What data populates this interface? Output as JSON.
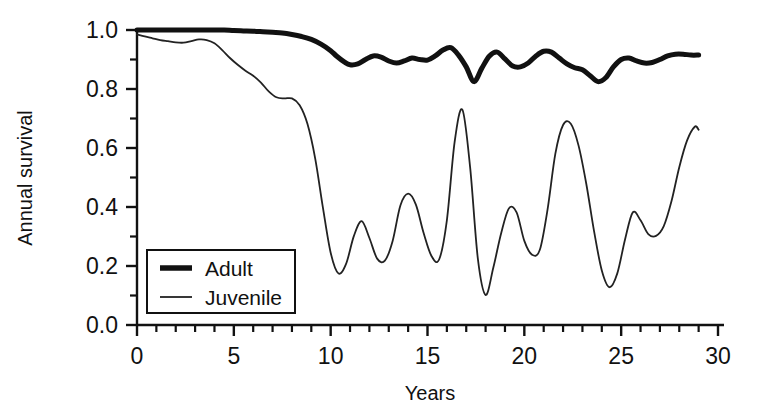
{
  "chart_data": {
    "type": "line",
    "title": "",
    "xlabel": "Years",
    "ylabel": "Annual survival",
    "xlim": [
      0,
      30
    ],
    "ylim": [
      0.0,
      1.0
    ],
    "grid": false,
    "legend_position": "lower-left",
    "x_major_ticks": [
      0,
      5,
      10,
      15,
      20,
      25,
      30
    ],
    "x_major_tick_labels": [
      "0",
      "5",
      "10",
      "15",
      "20",
      "25",
      "30"
    ],
    "x_minor_tick_step": 1,
    "y_major_ticks": [
      0.0,
      0.2,
      0.4,
      0.6,
      0.8,
      1.0
    ],
    "y_major_tick_labels": [
      "0.0",
      "0.2",
      "0.4",
      "0.6",
      "0.8",
      "1.0"
    ],
    "y_minor_tick_step": 0.1,
    "series": [
      {
        "name": "Adult",
        "line_width": 5,
        "color": "#111111",
        "x": [
          0,
          0.5,
          1,
          1.5,
          2,
          2.5,
          3,
          3.5,
          4,
          4.5,
          5,
          5.5,
          6,
          6.5,
          7,
          7.5,
          8,
          8.5,
          9,
          9.5,
          10,
          10.3,
          10.7,
          11,
          11.4,
          11.8,
          12.2,
          12.6,
          13,
          13.4,
          13.8,
          14.2,
          14.6,
          15,
          15.4,
          15.8,
          16.2,
          16.6,
          17,
          17.4,
          17.8,
          18.2,
          18.6,
          19,
          19.4,
          19.8,
          20.2,
          20.6,
          21,
          21.4,
          21.8,
          22.2,
          22.6,
          23,
          23.4,
          23.8,
          24.2,
          24.6,
          25,
          25.4,
          25.8,
          26.2,
          26.6,
          27,
          27.4,
          27.8,
          28.2,
          28.6,
          29
        ],
        "y": [
          1.0,
          1.0,
          1.0,
          1.0,
          1.0,
          1.0,
          1.0,
          1.0,
          1.0,
          1.0,
          0.998,
          0.997,
          0.996,
          0.994,
          0.992,
          0.99,
          0.985,
          0.978,
          0.968,
          0.952,
          0.93,
          0.912,
          0.892,
          0.882,
          0.885,
          0.9,
          0.912,
          0.908,
          0.895,
          0.888,
          0.895,
          0.905,
          0.9,
          0.898,
          0.912,
          0.932,
          0.94,
          0.915,
          0.875,
          0.825,
          0.87,
          0.912,
          0.925,
          0.902,
          0.878,
          0.875,
          0.888,
          0.912,
          0.928,
          0.925,
          0.905,
          0.885,
          0.872,
          0.865,
          0.845,
          0.825,
          0.838,
          0.875,
          0.9,
          0.905,
          0.895,
          0.888,
          0.89,
          0.9,
          0.912,
          0.918,
          0.918,
          0.915,
          0.915
        ]
      },
      {
        "name": "Juvenile",
        "line_width": 1.8,
        "color": "#222222",
        "x": [
          0,
          0.4,
          0.8,
          1.2,
          1.6,
          2.0,
          2.4,
          2.8,
          3.2,
          3.6,
          4.0,
          4.4,
          4.8,
          5.2,
          5.6,
          6.0,
          6.4,
          6.8,
          7.2,
          7.6,
          8.0,
          8.4,
          8.8,
          9.2,
          9.6,
          10.0,
          10.4,
          10.8,
          11.2,
          11.6,
          12.0,
          12.4,
          12.8,
          13.2,
          13.6,
          14.0,
          14.4,
          14.8,
          15.2,
          15.6,
          16.0,
          16.4,
          16.8,
          17.2,
          17.6,
          18.0,
          18.4,
          18.8,
          19.2,
          19.6,
          20.0,
          20.4,
          20.8,
          21.2,
          21.6,
          22.0,
          22.4,
          22.8,
          23.2,
          23.6,
          24.0,
          24.4,
          24.8,
          25.2,
          25.6,
          26.0,
          26.4,
          26.8,
          27.2,
          27.6,
          28.0,
          28.4,
          28.8,
          29.0
        ],
        "y": [
          0.985,
          0.978,
          0.972,
          0.966,
          0.962,
          0.958,
          0.957,
          0.962,
          0.968,
          0.966,
          0.955,
          0.932,
          0.905,
          0.882,
          0.862,
          0.845,
          0.822,
          0.792,
          0.772,
          0.768,
          0.768,
          0.745,
          0.682,
          0.565,
          0.398,
          0.245,
          0.175,
          0.208,
          0.302,
          0.352,
          0.295,
          0.225,
          0.218,
          0.285,
          0.405,
          0.445,
          0.408,
          0.312,
          0.235,
          0.222,
          0.355,
          0.62,
          0.73,
          0.535,
          0.225,
          0.102,
          0.195,
          0.31,
          0.395,
          0.382,
          0.285,
          0.238,
          0.255,
          0.392,
          0.58,
          0.678,
          0.682,
          0.608,
          0.478,
          0.318,
          0.185,
          0.128,
          0.175,
          0.29,
          0.382,
          0.355,
          0.308,
          0.302,
          0.335,
          0.42,
          0.535,
          0.625,
          0.672,
          0.662
        ]
      }
    ]
  },
  "legend": {
    "items": [
      {
        "label": "Adult",
        "style": "thick"
      },
      {
        "label": "Juvenile",
        "style": "thin"
      }
    ]
  },
  "axes": {
    "x_title": "Years",
    "y_title": "Annual survival"
  }
}
